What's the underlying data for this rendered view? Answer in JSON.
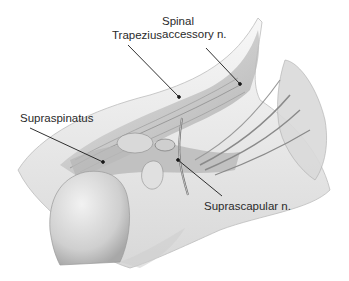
{
  "figure": {
    "labels": [
      {
        "id": "spinal-accessory",
        "lines": [
          "Spinal",
          "accessory n."
        ]
      },
      {
        "id": "trapezius",
        "lines": [
          "Trapezius"
        ]
      },
      {
        "id": "supraspinatus",
        "lines": [
          "Supraspinatus"
        ]
      },
      {
        "id": "suprascapular",
        "lines": [
          "Suprascapular n."
        ]
      }
    ]
  }
}
